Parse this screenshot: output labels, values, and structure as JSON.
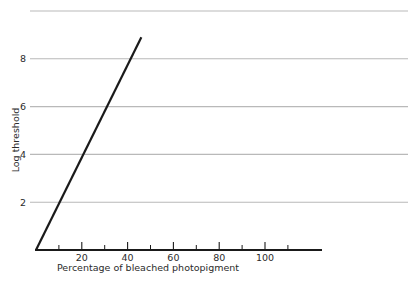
{
  "chart_data": {
    "type": "line",
    "title": "",
    "subtitle": "",
    "xlabel": "Percentage of bleached photopigment",
    "ylabel": "Log threshold",
    "xlim": [
      0,
      125
    ],
    "ylim": [
      0,
      10.2
    ],
    "grid": "horizontal",
    "legend": "none",
    "x_ticks_major": [
      20,
      40,
      60,
      80,
      100
    ],
    "x_tick_labels": [
      "20",
      "40",
      "60",
      "80",
      "100"
    ],
    "x_ticks_minor": [
      10,
      30,
      50,
      70,
      90,
      110
    ],
    "y_ticks_major": [
      2,
      4,
      6,
      8
    ],
    "y_tick_labels": [
      "2",
      "4",
      "6",
      "8"
    ],
    "y_gridlines": [
      2,
      4,
      6,
      8,
      10
    ],
    "series": [
      {
        "name": "threshold",
        "color": "#1a1a1a",
        "width": 2.2,
        "x": [
          0,
          46
        ],
        "y": [
          0,
          8.9
        ]
      }
    ],
    "colors": {
      "background": "#ffffff",
      "axis": "#1a1a1a",
      "gridline": "#b9b9b9",
      "text": "#2b2b2b",
      "line": "#1a1a1a"
    }
  }
}
